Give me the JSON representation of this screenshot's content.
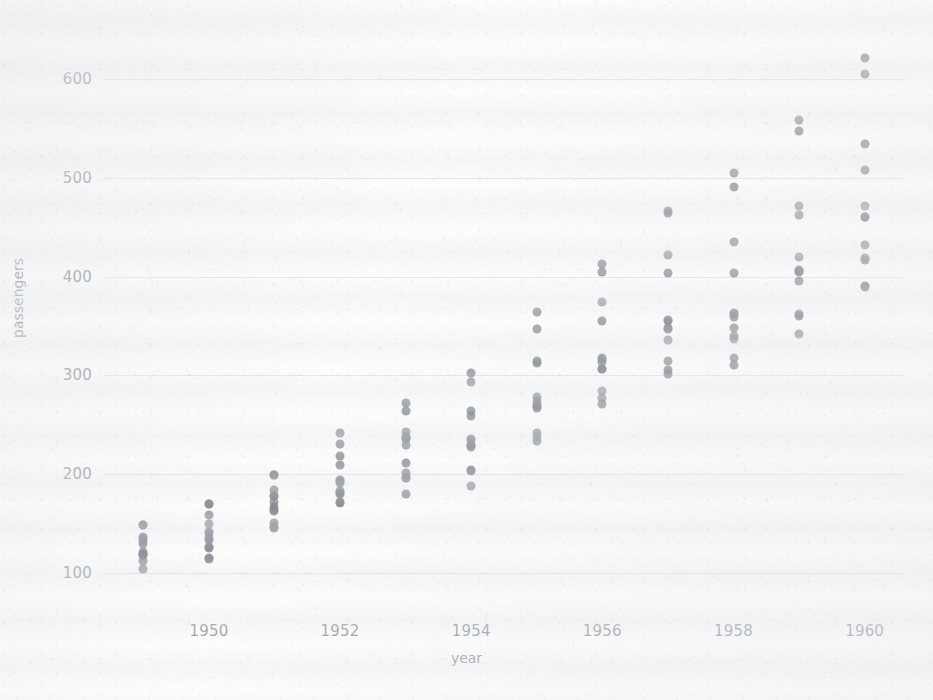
{
  "chart_data": {
    "type": "scatter",
    "title": "",
    "xlabel": "year",
    "ylabel": "passengers",
    "xlim": [
      1948.4,
      1960.6
    ],
    "ylim": [
      60,
      640
    ],
    "grid": true,
    "legend": null,
    "x_ticks": [
      1950,
      1952,
      1954,
      1956,
      1958,
      1960
    ],
    "y_ticks": [
      100,
      200,
      300,
      400,
      500,
      600
    ],
    "x_tick_labels": [
      "1950",
      "1952",
      "1954",
      "1956",
      "1958",
      "1960"
    ],
    "y_tick_labels": [
      "100",
      "200",
      "300",
      "400",
      "500",
      "600"
    ],
    "point_color": "#74797f",
    "background_color": "#fdfdfd",
    "grid_color": "#cdcfd4",
    "tick_color": "#8c8f96",
    "note": "Monthly airline passenger counts, 12 points per year (flights dataset)",
    "series": [
      {
        "name": "passengers",
        "points": [
          {
            "x": 1949,
            "y": 112
          },
          {
            "x": 1949,
            "y": 118
          },
          {
            "x": 1949,
            "y": 132
          },
          {
            "x": 1949,
            "y": 129
          },
          {
            "x": 1949,
            "y": 121
          },
          {
            "x": 1949,
            "y": 135
          },
          {
            "x": 1949,
            "y": 148
          },
          {
            "x": 1949,
            "y": 148
          },
          {
            "x": 1949,
            "y": 136
          },
          {
            "x": 1949,
            "y": 119
          },
          {
            "x": 1949,
            "y": 104
          },
          {
            "x": 1949,
            "y": 118
          },
          {
            "x": 1950,
            "y": 115
          },
          {
            "x": 1950,
            "y": 126
          },
          {
            "x": 1950,
            "y": 141
          },
          {
            "x": 1950,
            "y": 135
          },
          {
            "x": 1950,
            "y": 125
          },
          {
            "x": 1950,
            "y": 149
          },
          {
            "x": 1950,
            "y": 170
          },
          {
            "x": 1950,
            "y": 170
          },
          {
            "x": 1950,
            "y": 158
          },
          {
            "x": 1950,
            "y": 133
          },
          {
            "x": 1950,
            "y": 114
          },
          {
            "x": 1950,
            "y": 140
          },
          {
            "x": 1951,
            "y": 145
          },
          {
            "x": 1951,
            "y": 150
          },
          {
            "x": 1951,
            "y": 178
          },
          {
            "x": 1951,
            "y": 163
          },
          {
            "x": 1951,
            "y": 172
          },
          {
            "x": 1951,
            "y": 178
          },
          {
            "x": 1951,
            "y": 199
          },
          {
            "x": 1951,
            "y": 199
          },
          {
            "x": 1951,
            "y": 184
          },
          {
            "x": 1951,
            "y": 162
          },
          {
            "x": 1951,
            "y": 146
          },
          {
            "x": 1951,
            "y": 166
          },
          {
            "x": 1952,
            "y": 171
          },
          {
            "x": 1952,
            "y": 180
          },
          {
            "x": 1952,
            "y": 193
          },
          {
            "x": 1952,
            "y": 181
          },
          {
            "x": 1952,
            "y": 183
          },
          {
            "x": 1952,
            "y": 218
          },
          {
            "x": 1952,
            "y": 230
          },
          {
            "x": 1952,
            "y": 242
          },
          {
            "x": 1952,
            "y": 209
          },
          {
            "x": 1952,
            "y": 191
          },
          {
            "x": 1952,
            "y": 172
          },
          {
            "x": 1952,
            "y": 194
          },
          {
            "x": 1953,
            "y": 196
          },
          {
            "x": 1953,
            "y": 196
          },
          {
            "x": 1953,
            "y": 236
          },
          {
            "x": 1953,
            "y": 235
          },
          {
            "x": 1953,
            "y": 229
          },
          {
            "x": 1953,
            "y": 243
          },
          {
            "x": 1953,
            "y": 264
          },
          {
            "x": 1953,
            "y": 272
          },
          {
            "x": 1953,
            "y": 237
          },
          {
            "x": 1953,
            "y": 211
          },
          {
            "x": 1953,
            "y": 180
          },
          {
            "x": 1953,
            "y": 201
          },
          {
            "x": 1954,
            "y": 204
          },
          {
            "x": 1954,
            "y": 188
          },
          {
            "x": 1954,
            "y": 235
          },
          {
            "x": 1954,
            "y": 227
          },
          {
            "x": 1954,
            "y": 234
          },
          {
            "x": 1954,
            "y": 264
          },
          {
            "x": 1954,
            "y": 302
          },
          {
            "x": 1954,
            "y": 293
          },
          {
            "x": 1954,
            "y": 259
          },
          {
            "x": 1954,
            "y": 229
          },
          {
            "x": 1954,
            "y": 203
          },
          {
            "x": 1954,
            "y": 229
          },
          {
            "x": 1955,
            "y": 242
          },
          {
            "x": 1955,
            "y": 233
          },
          {
            "x": 1955,
            "y": 267
          },
          {
            "x": 1955,
            "y": 269
          },
          {
            "x": 1955,
            "y": 270
          },
          {
            "x": 1955,
            "y": 315
          },
          {
            "x": 1955,
            "y": 364
          },
          {
            "x": 1955,
            "y": 347
          },
          {
            "x": 1955,
            "y": 312
          },
          {
            "x": 1955,
            "y": 274
          },
          {
            "x": 1955,
            "y": 237
          },
          {
            "x": 1955,
            "y": 278
          },
          {
            "x": 1956,
            "y": 284
          },
          {
            "x": 1956,
            "y": 277
          },
          {
            "x": 1956,
            "y": 317
          },
          {
            "x": 1956,
            "y": 313
          },
          {
            "x": 1956,
            "y": 318
          },
          {
            "x": 1956,
            "y": 374
          },
          {
            "x": 1956,
            "y": 413
          },
          {
            "x": 1956,
            "y": 405
          },
          {
            "x": 1956,
            "y": 355
          },
          {
            "x": 1956,
            "y": 306
          },
          {
            "x": 1956,
            "y": 271
          },
          {
            "x": 1956,
            "y": 306
          },
          {
            "x": 1957,
            "y": 315
          },
          {
            "x": 1957,
            "y": 301
          },
          {
            "x": 1957,
            "y": 356
          },
          {
            "x": 1957,
            "y": 348
          },
          {
            "x": 1957,
            "y": 355
          },
          {
            "x": 1957,
            "y": 422
          },
          {
            "x": 1957,
            "y": 465
          },
          {
            "x": 1957,
            "y": 467
          },
          {
            "x": 1957,
            "y": 404
          },
          {
            "x": 1957,
            "y": 347
          },
          {
            "x": 1957,
            "y": 305
          },
          {
            "x": 1957,
            "y": 336
          },
          {
            "x": 1958,
            "y": 340
          },
          {
            "x": 1958,
            "y": 318
          },
          {
            "x": 1958,
            "y": 362
          },
          {
            "x": 1958,
            "y": 348
          },
          {
            "x": 1958,
            "y": 363
          },
          {
            "x": 1958,
            "y": 435
          },
          {
            "x": 1958,
            "y": 491
          },
          {
            "x": 1958,
            "y": 505
          },
          {
            "x": 1958,
            "y": 404
          },
          {
            "x": 1958,
            "y": 359
          },
          {
            "x": 1958,
            "y": 310
          },
          {
            "x": 1958,
            "y": 337
          },
          {
            "x": 1959,
            "y": 360
          },
          {
            "x": 1959,
            "y": 342
          },
          {
            "x": 1959,
            "y": 406
          },
          {
            "x": 1959,
            "y": 396
          },
          {
            "x": 1959,
            "y": 420
          },
          {
            "x": 1959,
            "y": 472
          },
          {
            "x": 1959,
            "y": 548
          },
          {
            "x": 1959,
            "y": 559
          },
          {
            "x": 1959,
            "y": 463
          },
          {
            "x": 1959,
            "y": 407
          },
          {
            "x": 1959,
            "y": 362
          },
          {
            "x": 1959,
            "y": 405
          },
          {
            "x": 1960,
            "y": 417
          },
          {
            "x": 1960,
            "y": 391
          },
          {
            "x": 1960,
            "y": 419
          },
          {
            "x": 1960,
            "y": 461
          },
          {
            "x": 1960,
            "y": 472
          },
          {
            "x": 1960,
            "y": 535
          },
          {
            "x": 1960,
            "y": 622
          },
          {
            "x": 1960,
            "y": 606
          },
          {
            "x": 1960,
            "y": 508
          },
          {
            "x": 1960,
            "y": 461
          },
          {
            "x": 1960,
            "y": 390
          },
          {
            "x": 1960,
            "y": 432
          }
        ]
      }
    ]
  }
}
